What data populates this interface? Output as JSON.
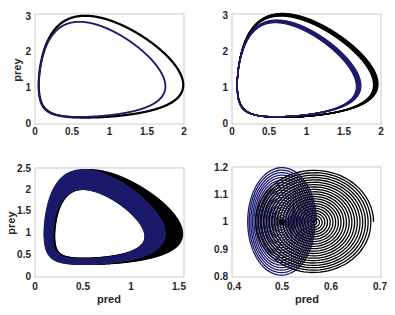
{
  "chart_data": [
    {
      "type": "line",
      "panel": "top-left",
      "title": "",
      "xlabel": "",
      "ylabel": "prey",
      "xlim": [
        0,
        2
      ],
      "ylim": [
        0,
        3.1
      ],
      "xticks": [
        "0",
        "0.5",
        "1",
        "1.5",
        "2"
      ],
      "yticks": [
        "0",
        "1",
        "2",
        "3"
      ],
      "grid": false,
      "series": [
        {
          "name": "black-orbit",
          "color": "#000000",
          "width": 2.2,
          "center": [
            0.62,
            1.0
          ],
          "x_range": [
            0.05,
            1.99
          ],
          "y_range": [
            0.18,
            3.05
          ],
          "loops": 1
        },
        {
          "name": "blue-orbit",
          "color": "#1c1a6b",
          "width": 1.8,
          "center": [
            0.6,
            1.0
          ],
          "x_range": [
            0.05,
            1.75
          ],
          "y_range": [
            0.2,
            2.88
          ],
          "loops": 1
        }
      ]
    },
    {
      "type": "line",
      "panel": "top-right",
      "title": "",
      "xlabel": "",
      "ylabel": "",
      "xlim": [
        0,
        2
      ],
      "ylim": [
        0,
        3.0
      ],
      "xticks": [
        "0",
        "0.5",
        "1",
        "1.5",
        "2"
      ],
      "yticks": [
        "0",
        "1",
        "2",
        "3"
      ],
      "grid": false,
      "series": [
        {
          "name": "black-orbit",
          "color": "#000000",
          "width": 1.2,
          "center": [
            0.62,
            1.0
          ],
          "x_range": [
            0.07,
            1.93
          ],
          "y_range": [
            0.18,
            2.98
          ],
          "loops": 8,
          "spread": 0.06
        },
        {
          "name": "blue-orbit",
          "color": "#1c1a6b",
          "width": 1.2,
          "center": [
            0.6,
            1.0
          ],
          "x_range": [
            0.07,
            1.7
          ],
          "y_range": [
            0.2,
            2.8
          ],
          "loops": 8,
          "spread": 0.06
        }
      ]
    },
    {
      "type": "line",
      "panel": "bottom-left",
      "title": "",
      "xlabel": "pred",
      "ylabel": "prey",
      "xlim": [
        0,
        1.55
      ],
      "ylim": [
        0,
        2.5
      ],
      "xticks": [
        "0",
        "0.5",
        "1",
        "1.5"
      ],
      "yticks": [
        "0",
        "0.5",
        "1",
        "1.5",
        "2",
        "2.5"
      ],
      "grid": false,
      "series": [
        {
          "name": "black-band",
          "color": "#000000",
          "width": 1.2,
          "center": [
            0.55,
            1.0
          ],
          "x_range": [
            0.12,
            1.53
          ],
          "y_range": [
            0.3,
            2.45
          ],
          "inner_x_range": [
            0.2,
            1.15
          ],
          "inner_y_range": [
            0.42,
            2.02
          ]
        },
        {
          "name": "blue-band",
          "color": "#1c1a6b",
          "width": 1.2,
          "center": [
            0.55,
            1.0
          ],
          "x_range": [
            0.1,
            1.35
          ],
          "y_range": [
            0.3,
            2.45
          ],
          "inner_x_range": [
            0.18,
            1.15
          ],
          "inner_y_range": [
            0.4,
            2.02
          ]
        }
      ]
    },
    {
      "type": "line",
      "panel": "bottom-right",
      "title": "",
      "xlabel": "pred",
      "ylabel": "",
      "xlim": [
        0.4,
        0.7
      ],
      "ylim": [
        0.8,
        1.2
      ],
      "xticks": [
        "0.4",
        "0.5",
        "0.6",
        "0.7"
      ],
      "yticks": [
        "0.8",
        "0.9",
        "1",
        "1.1",
        "1.2"
      ],
      "grid": false,
      "series": [
        {
          "name": "black-spiral",
          "color": "#000000",
          "width": 1.0,
          "center": [
            0.565,
            1.0
          ],
          "outer_rx": 0.12,
          "outer_ry": 0.19,
          "inner_r": 0.0,
          "turns": 22
        },
        {
          "name": "blue-spiral",
          "color": "#1c1a6b",
          "width": 1.0,
          "center": [
            0.5,
            1.0
          ],
          "outer_rx": 0.07,
          "outer_ry": 0.2,
          "inner_r": 0.0,
          "turns": 22
        }
      ]
    }
  ],
  "panels": {
    "top_left": {
      "ylabel": "prey",
      "xticks": [
        "0",
        "0.5",
        "1",
        "1.5",
        "2"
      ],
      "yticks": [
        "0",
        "1",
        "2",
        "3"
      ]
    },
    "top_right": {
      "xticks": [
        "0",
        "0.5",
        "1",
        "1.5",
        "2"
      ],
      "yticks": [
        "0",
        "1",
        "2",
        "3"
      ]
    },
    "bottom_left": {
      "xlabel": "pred",
      "ylabel": "prey",
      "xticks": [
        "0",
        "0.5",
        "1",
        "1.5"
      ],
      "yticks": [
        "0",
        "0.5",
        "1",
        "1.5",
        "2",
        "2.5"
      ]
    },
    "bottom_right": {
      "xlabel": "pred",
      "xticks": [
        "0.4",
        "0.5",
        "0.6",
        "0.7"
      ],
      "yticks": [
        "0.8",
        "0.9",
        "1",
        "1.1",
        "1.2"
      ]
    }
  },
  "colors": {
    "black": "#000000",
    "blue": "#1c1a6b",
    "axis": "#bdbdbd",
    "text": "#262626"
  }
}
